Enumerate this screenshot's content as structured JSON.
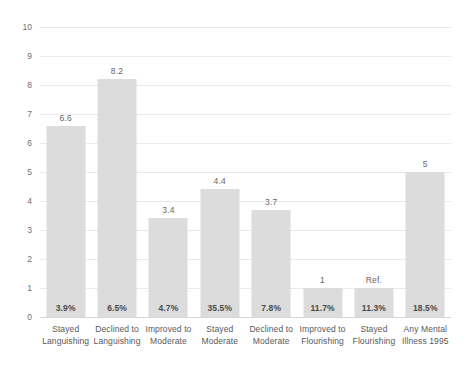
{
  "chart_data": {
    "type": "bar",
    "title": "",
    "subtitle": "",
    "xlabel": "",
    "ylabel": "",
    "ylim": [
      0,
      10
    ],
    "ytick_labels": [
      "0",
      "1",
      "2",
      "3",
      "4",
      "5",
      "6",
      "7",
      "8",
      "9",
      "10"
    ],
    "ytick_values": [
      0,
      1,
      2,
      3,
      4,
      5,
      6,
      7,
      8,
      9,
      10
    ],
    "grid": true,
    "legend": null,
    "categories": [
      "Stayed Languishing",
      "Declined to Languishing",
      "Improved to Moderate",
      "Stayed Moderate",
      "Declined to Moderate",
      "Improved to Flourishing",
      "Stayed Flourishing",
      "Any Mental Illness 1995"
    ],
    "category_lines": [
      [
        "Stayed",
        "Languishing"
      ],
      [
        "Declined to",
        "Languishing"
      ],
      [
        "Improved to",
        "Moderate"
      ],
      [
        "Stayed",
        "Moderate"
      ],
      [
        "Declined to",
        "Moderate"
      ],
      [
        "Improved to",
        "Flourishing"
      ],
      [
        "Stayed",
        "Flourishing"
      ],
      [
        "Any Mental",
        "Illness 1995"
      ]
    ],
    "values": [
      6.6,
      8.2,
      3.4,
      4.4,
      3.7,
      1,
      1,
      5
    ],
    "value_labels": [
      "6.6",
      "8.2",
      "3.4",
      "4.4",
      "3.7",
      "1",
      "Ref.",
      "5"
    ],
    "percent_labels": [
      "3.9%",
      "6.5%",
      "4.7%",
      "35.5%",
      "7.8%",
      "11.7%",
      "11.3%",
      "18.5%"
    ],
    "bar_color": "#dcdcdc",
    "gridline_color": "#e9e9e9",
    "axis_color": "#d6d6d6",
    "value_label_color": "#666666",
    "percent_label_color": "#4a4a4a",
    "category_label_color": "#58595b"
  }
}
